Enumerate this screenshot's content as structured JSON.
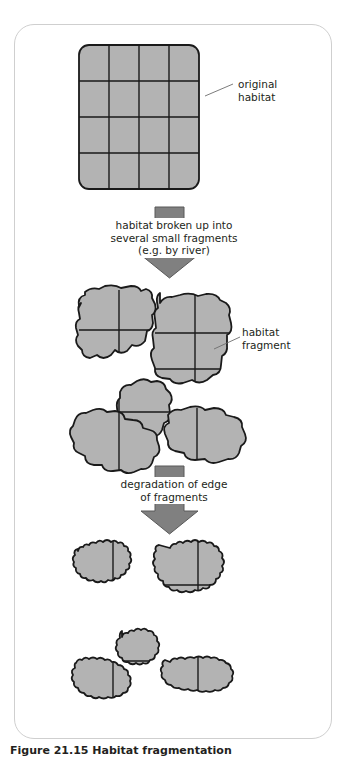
{
  "figure": {
    "caption_number": "Figure 21.15",
    "caption_text": "Habitat fragmentation",
    "caption_full": "Figure 21.15 Habitat fragmentation"
  },
  "labels": {
    "original_habitat": "original\nhabitat",
    "habitat_fragment": "habitat\nfragment"
  },
  "arrows": [
    {
      "name": "arrow-fragmentation",
      "text": "habitat broken up into\nseveral small fragments\n(e.g. by river)"
    },
    {
      "name": "arrow-degradation",
      "text": "degradation of edge\nof fragments"
    }
  ],
  "colors": {
    "habitat_fill": "#b3b3b3",
    "habitat_stroke": "#1a1a1a",
    "grid_line": "#1a1a1a",
    "arrow_fill": "#808080",
    "arrow_stroke": "#4d4d4d",
    "card_border": "#cfcfcf",
    "text": "#231f20",
    "leader_line": "#6d6d6d",
    "background": "#ffffff"
  },
  "stages": [
    {
      "name": "stage-original-habitat",
      "description": "intact square habitat divided into a 4 by 4 grid",
      "fragment_count": 1,
      "grid_rows": 4,
      "grid_cols": 4
    },
    {
      "name": "stage-fragmented-habitat",
      "description": "habitat broken into several irregular fragments separated by gaps",
      "fragment_count": 5
    },
    {
      "name": "stage-degraded-habitat",
      "description": "fragments with degraded, eroded, jagged edges and smaller area",
      "fragment_count": 5
    }
  ]
}
